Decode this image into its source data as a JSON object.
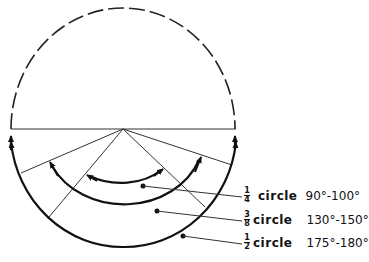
{
  "diagram": {
    "type": "range-of-motion-circle",
    "outer_circle": {
      "upper_half": "dashed",
      "lower_half": "solid with arrows at both ends"
    },
    "labels": [
      {
        "numerator": "1",
        "denominator": "4",
        "word": "circle",
        "range": "90°-100°"
      },
      {
        "numerator": "3",
        "denominator": "8",
        "word": "circle",
        "range": "130°-150°"
      },
      {
        "numerator": "1",
        "denominator": "2",
        "word": "circle",
        "range": "175°-180°"
      }
    ]
  }
}
